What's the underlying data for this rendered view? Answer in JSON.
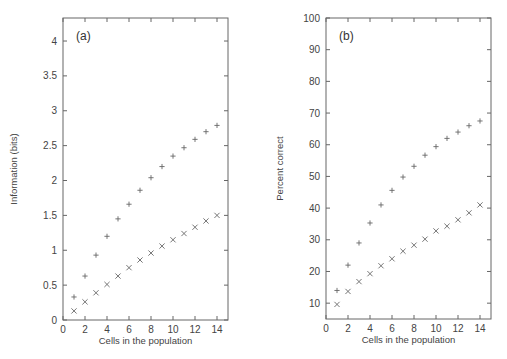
{
  "chart_data": [
    {
      "type": "scatter",
      "panel_label": "(a)",
      "xlabel": "Cells in the population",
      "ylabel": "Information (bits)",
      "xlim": [
        0,
        15
      ],
      "ylim": [
        0,
        4.33
      ],
      "xticks": [
        0,
        2,
        4,
        6,
        8,
        10,
        12,
        14
      ],
      "yticks": [
        0,
        0.5,
        1,
        1.5,
        2,
        2.5,
        3,
        3.5,
        4
      ],
      "ytick_labels": [
        "0",
        "0.5",
        "1",
        "1.5",
        "2",
        "2.5",
        "3",
        "3.5",
        "4"
      ],
      "grid": false,
      "legend": null,
      "x": [
        1,
        2,
        3,
        4,
        5,
        6,
        7,
        8,
        9,
        10,
        11,
        12,
        13,
        14
      ],
      "series": [
        {
          "name": "plus",
          "marker": "+",
          "values": [
            0.33,
            0.63,
            0.93,
            1.2,
            1.45,
            1.66,
            1.86,
            2.04,
            2.2,
            2.35,
            2.47,
            2.59,
            2.7,
            2.79
          ]
        },
        {
          "name": "cross",
          "marker": "x",
          "values": [
            0.13,
            0.26,
            0.39,
            0.51,
            0.63,
            0.75,
            0.86,
            0.96,
            1.06,
            1.15,
            1.24,
            1.33,
            1.42,
            1.5
          ]
        }
      ]
    },
    {
      "type": "scatter",
      "panel_label": "(b)",
      "xlabel": "Cells in the population",
      "ylabel": "Percent correct",
      "xlim": [
        0,
        15
      ],
      "ylim": [
        5,
        100
      ],
      "xticks": [
        0,
        2,
        4,
        6,
        8,
        10,
        12,
        14
      ],
      "yticks": [
        10,
        20,
        30,
        40,
        50,
        60,
        70,
        80,
        90,
        100
      ],
      "ytick_labels": [
        "10",
        "20",
        "30",
        "40",
        "50",
        "60",
        "70",
        "80",
        "90",
        "100"
      ],
      "grid": false,
      "legend": null,
      "x": [
        1,
        2,
        3,
        4,
        5,
        6,
        7,
        8,
        9,
        10,
        11,
        12,
        13,
        14
      ],
      "series": [
        {
          "name": "plus",
          "marker": "+",
          "values": [
            14.0,
            22.0,
            29.0,
            35.3,
            41.0,
            45.6,
            49.8,
            53.2,
            56.7,
            59.4,
            62.0,
            64.0,
            66.0,
            67.5
          ]
        },
        {
          "name": "cross",
          "marker": "x",
          "values": [
            9.6,
            13.7,
            16.8,
            19.3,
            21.8,
            24.0,
            26.4,
            28.3,
            30.2,
            32.8,
            34.3,
            36.3,
            38.5,
            41.0
          ]
        }
      ]
    }
  ],
  "layout": {
    "panels": [
      {
        "left": 63,
        "right": 228,
        "top": 18,
        "bottom": 320,
        "ylabel_x": 17
      },
      {
        "left": 326,
        "right": 491,
        "top": 18,
        "bottom": 319,
        "ylabel_x": 283
      }
    ],
    "colors": {
      "axis": "#666666",
      "marker": "#666666",
      "text": "#444444"
    }
  }
}
